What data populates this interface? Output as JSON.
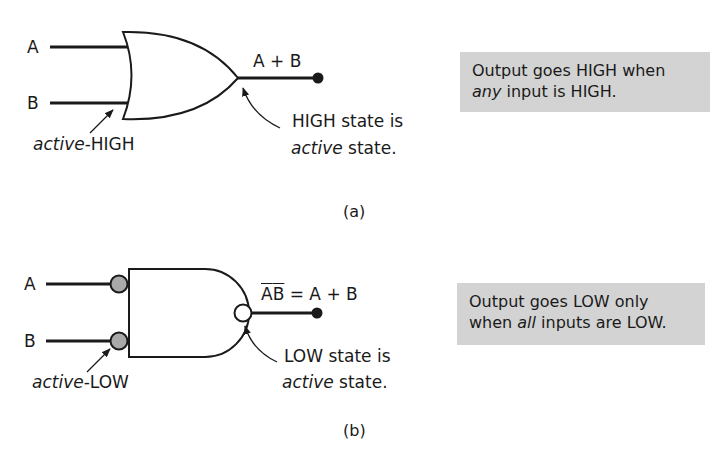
{
  "panel_a": {
    "input_a": "A",
    "input_b": "B",
    "output_expr": "A + B",
    "input_annotation": {
      "italic": "active",
      "rest": "-HIGH"
    },
    "output_annotation": {
      "line1": "HIGH state is",
      "line2_italic": "active",
      "line2_rest": " state."
    },
    "note": {
      "line1": "Output goes HIGH when",
      "line2_italic": "any",
      "line2_rest": " input is HIGH."
    },
    "caption": "(a)",
    "gate": "OR"
  },
  "panel_b": {
    "input_a": "A",
    "input_b": "B",
    "output_expr_bar_left": "A",
    "output_expr_bar_right": "B",
    "output_expr_rest": " = A + B",
    "input_annotation": {
      "italic": "active",
      "rest": "-LOW"
    },
    "output_annotation": {
      "line1": "LOW state is",
      "line2_italic": "active",
      "line2_rest": " state."
    },
    "note": {
      "line1": "Output goes LOW only",
      "line2_pre": "when ",
      "line2_italic": "all",
      "line2_rest": " inputs are LOW."
    },
    "caption": "(b)",
    "gate": "NAND (bubbled inputs)"
  },
  "colors": {
    "note_bg": "#d3d3d3",
    "bubble_gray": "#a9a9a9",
    "line": "#1a1a1a"
  }
}
